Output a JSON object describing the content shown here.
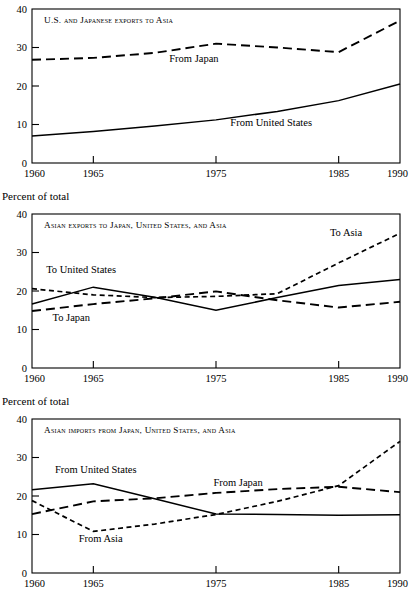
{
  "figure": {
    "panel_count": 3,
    "ink_color": "#000000",
    "background_color": "#ffffff"
  },
  "panels": [
    {
      "id": "us-japanese-exports-to-asia",
      "title": "U.S. and Japanese exports to Asia",
      "axis_caption": "",
      "series_labels": [
        {
          "name": "From Japan",
          "x": 1973.2,
          "y": 26.2
        },
        {
          "name": "From United States",
          "x": 1979.5,
          "y": 9.6
        }
      ]
    },
    {
      "id": "asian-exports",
      "title": "Asian exports to Japan, United States, and Asia",
      "axis_caption": "Percent of total",
      "series_labels": [
        {
          "name": "To Asia",
          "x": 1985.6,
          "y": 34.2
        },
        {
          "name": "To United States",
          "x": 1964.0,
          "y": 24.6
        },
        {
          "name": "To Japan",
          "x": 1963.2,
          "y": 12.2
        }
      ]
    },
    {
      "id": "asian-imports",
      "title": "Asian imports from Japan, United States, and Asia",
      "axis_caption": "Percent of total",
      "series_labels": [
        {
          "name": "From United States",
          "x": 1965.2,
          "y": 25.9
        },
        {
          "name": "From Japan",
          "x": 1976.8,
          "y": 22.6
        },
        {
          "name": "From Asia",
          "x": 1965.6,
          "y": 8.0
        }
      ]
    }
  ],
  "chart_data": [
    {
      "type": "line",
      "title": "U.S. and Japanese exports to Asia",
      "xlabel": "",
      "ylabel": "",
      "xlim": [
        1960,
        1990
      ],
      "ylim": [
        0,
        40
      ],
      "xticks": [
        1960,
        1965,
        1975,
        1985,
        1990
      ],
      "xtick_labels": [
        "1960",
        "1965",
        "1975",
        "1985",
        "1990"
      ],
      "yticks": [
        0,
        10,
        20,
        30,
        40
      ],
      "ytick_labels": [
        "0",
        "10",
        "20",
        "30",
        "40"
      ],
      "grid": false,
      "legend": "inline-annotations",
      "x": [
        1960,
        1965,
        1970,
        1975,
        1980,
        1985,
        1990
      ],
      "series": [
        {
          "name": "From Japan",
          "style": "dashed-long",
          "values": [
            26.8,
            27.3,
            28.6,
            31.0,
            30.0,
            28.8,
            37.0
          ]
        },
        {
          "name": "From United States",
          "style": "solid",
          "values": [
            7.0,
            8.2,
            9.6,
            11.2,
            13.4,
            16.2,
            20.5
          ]
        }
      ]
    },
    {
      "type": "line",
      "title": "Asian exports to Japan, United States, and Asia",
      "xlabel": "",
      "ylabel": "Percent of total",
      "xlim": [
        1960,
        1990
      ],
      "ylim": [
        0,
        40
      ],
      "xticks": [
        1960,
        1965,
        1975,
        1985,
        1990
      ],
      "xtick_labels": [
        "1960",
        "1965",
        "1975",
        "1985",
        "1990"
      ],
      "yticks": [
        0,
        10,
        20,
        30,
        40
      ],
      "ytick_labels": [
        "0",
        "10",
        "20",
        "30",
        "40"
      ],
      "grid": false,
      "legend": "inline-annotations",
      "x": [
        1960,
        1965,
        1970,
        1975,
        1980,
        1985,
        1990
      ],
      "series": [
        {
          "name": "To United States",
          "style": "solid",
          "values": [
            16.6,
            21.0,
            18.4,
            15.0,
            18.3,
            21.4,
            23.0
          ]
        },
        {
          "name": "To Japan",
          "style": "dashed-long",
          "values": [
            14.8,
            16.6,
            18.1,
            19.9,
            17.6,
            15.7,
            17.2
          ]
        },
        {
          "name": "To Asia",
          "style": "dashed-short",
          "values": [
            20.6,
            19.0,
            18.3,
            18.6,
            19.3,
            27.3,
            35.0
          ]
        }
      ]
    },
    {
      "type": "line",
      "title": "Asian imports from Japan, United States, and Asia",
      "xlabel": "",
      "ylabel": "Percent of total",
      "xlim": [
        1960,
        1990
      ],
      "ylim": [
        0,
        40
      ],
      "xticks": [
        1960,
        1965,
        1975,
        1985,
        1990
      ],
      "xtick_labels": [
        "1960",
        "1965",
        "1975",
        "1985",
        "1990"
      ],
      "yticks": [
        0,
        10,
        20,
        30,
        40
      ],
      "ytick_labels": [
        "0",
        "10",
        "20",
        "30",
        "40"
      ],
      "grid": false,
      "legend": "inline-annotations",
      "x": [
        1960,
        1965,
        1970,
        1975,
        1980,
        1985,
        1990
      ],
      "series": [
        {
          "name": "From United States",
          "style": "solid",
          "values": [
            21.6,
            23.2,
            19.3,
            15.3,
            15.2,
            15.0,
            15.1
          ]
        },
        {
          "name": "From Japan",
          "style": "dashed-long",
          "values": [
            15.3,
            18.6,
            19.4,
            20.8,
            21.8,
            22.4,
            21.0
          ]
        },
        {
          "name": "From Asia",
          "style": "dashed-short",
          "values": [
            18.8,
            10.8,
            12.7,
            15.2,
            18.6,
            22.7,
            34.2
          ]
        }
      ]
    }
  ]
}
